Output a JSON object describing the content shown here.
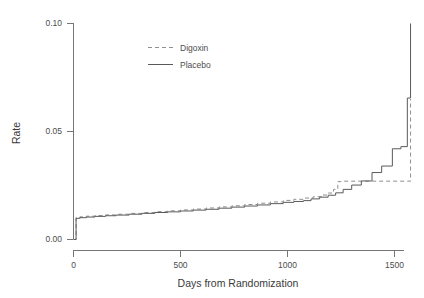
{
  "chart_data": {
    "type": "line",
    "subtype": "step",
    "title": "",
    "xlabel": "Days from Randomization",
    "ylabel": "Rate",
    "xlim": [
      -40,
      1610
    ],
    "ylim": [
      0.0,
      0.104
    ],
    "xticks": [
      0,
      500,
      1000,
      1500
    ],
    "xticklabels": [
      "0",
      "500",
      "1000",
      "1500"
    ],
    "yticks": [
      0.0,
      0.05,
      0.1
    ],
    "yticklabels": [
      "0.00",
      "0.05",
      "0.10"
    ],
    "grid": false,
    "legend_position": "top-center",
    "legend": [
      "Digoxin",
      "Placebo"
    ],
    "colors": {
      "digoxin": "#8f8f8f",
      "placebo": "#5a5a5a",
      "axis": "#767676",
      "text": "#4d4d4d",
      "background": "#ffffff"
    },
    "series": [
      {
        "name": "Digoxin",
        "style": "dashed",
        "color": "#8f8f8f",
        "x": [
          0,
          12,
          30,
          60,
          100,
          150,
          200,
          260,
          320,
          380,
          440,
          500,
          560,
          620,
          680,
          740,
          800,
          860,
          920,
          980,
          1030,
          1080,
          1120,
          1160,
          1190,
          1215,
          1235,
          1250,
          1560,
          1575
        ],
        "y": [
          0.0,
          0.0102,
          0.0105,
          0.0108,
          0.0111,
          0.0114,
          0.0117,
          0.0121,
          0.0125,
          0.0129,
          0.0133,
          0.0137,
          0.0141,
          0.0146,
          0.0151,
          0.0156,
          0.0162,
          0.0168,
          0.0174,
          0.0181,
          0.0186,
          0.0192,
          0.0198,
          0.0206,
          0.0215,
          0.0232,
          0.0268,
          0.027,
          0.027,
          0.065
        ]
      },
      {
        "name": "Placebo",
        "style": "solid",
        "color": "#5a5a5a",
        "x": [
          0,
          12,
          30,
          60,
          100,
          150,
          200,
          260,
          320,
          380,
          440,
          500,
          560,
          620,
          680,
          740,
          800,
          860,
          920,
          980,
          1030,
          1075,
          1110,
          1150,
          1190,
          1225,
          1260,
          1300,
          1345,
          1395,
          1440,
          1490,
          1530,
          1560,
          1575
        ],
        "y": [
          0.0,
          0.0098,
          0.0101,
          0.0104,
          0.0107,
          0.011,
          0.0113,
          0.0117,
          0.0121,
          0.0125,
          0.0128,
          0.0132,
          0.0136,
          0.014,
          0.0145,
          0.015,
          0.0155,
          0.016,
          0.0166,
          0.0172,
          0.0176,
          0.018,
          0.0188,
          0.0196,
          0.0205,
          0.0216,
          0.0232,
          0.0252,
          0.0271,
          0.031,
          0.034,
          0.042,
          0.043,
          0.0655,
          0.1
        ]
      }
    ]
  }
}
